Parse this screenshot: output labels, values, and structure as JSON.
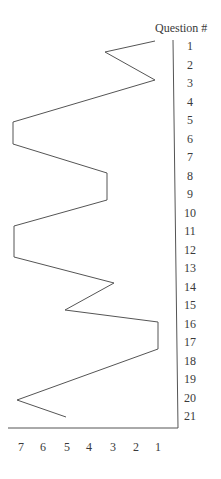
{
  "chart_data": {
    "type": "line",
    "title": "",
    "orientation": "horizontal-values-vertical-categories",
    "ylabel": "Question #",
    "xlabel": "",
    "categories": [
      "1",
      "2",
      "3",
      "4",
      "5",
      "6",
      "7",
      "8",
      "9",
      "10",
      "11",
      "12",
      "13",
      "14",
      "15",
      "16",
      "17",
      "18",
      "19",
      "20",
      "21"
    ],
    "x_ticks": [
      "7",
      "6",
      "5",
      "4",
      "3",
      "2",
      "1"
    ],
    "xlim": [
      7,
      1
    ],
    "grid": false,
    "legend": null,
    "points": [
      {
        "q": 1,
        "value": 1.1
      },
      {
        "q": 2,
        "value": 3.3
      },
      {
        "q": 3,
        "value": 1.1
      },
      {
        "q": 5,
        "value": 7.3
      },
      {
        "q": 6,
        "value": 7.3
      },
      {
        "q": 8,
        "value": 3.3
      },
      {
        "q": 9,
        "value": 3.3
      },
      {
        "q": 11,
        "value": 7.2
      },
      {
        "q": 12,
        "value": 7.2
      },
      {
        "q": 14,
        "value": 3.0
      },
      {
        "q": 15,
        "value": 5.0
      },
      {
        "q": 16,
        "value": 1.0
      },
      {
        "q": 17,
        "value": 1.0
      },
      {
        "q": 20,
        "value": 7.1
      },
      {
        "q": 21,
        "value": 5.0
      }
    ],
    "polyline_px": [
      [
        155,
        41
      ],
      [
        105,
        52
      ],
      [
        155,
        80
      ],
      [
        13,
        122
      ],
      [
        13,
        144
      ],
      [
        107,
        173
      ],
      [
        107,
        200
      ],
      [
        14,
        226
      ],
      [
        14,
        257
      ],
      [
        114,
        283
      ],
      [
        65,
        310
      ],
      [
        158,
        322
      ],
      [
        158,
        349
      ],
      [
        17,
        400
      ],
      [
        66,
        417
      ]
    ]
  }
}
